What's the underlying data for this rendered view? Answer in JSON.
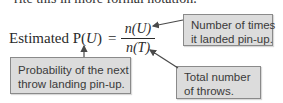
{
  "intro_text": "rite this in more formal notation.",
  "formula": {
    "lhs_prefix": "Estimated P(",
    "lhs_var": "U",
    "lhs_suffix": ")",
    "equals": "=",
    "numerator": "n(U)",
    "denominator": "n(T)"
  },
  "callouts": {
    "numerator_note": [
      "Number of times",
      "it landed pin-up."
    ],
    "probability_note": [
      "Probability of the next",
      "throw landing pin-up."
    ],
    "denominator_note": [
      "Total number",
      "of throws."
    ]
  },
  "colors": {
    "callout_fill": "#dcdcdc",
    "callout_border": "#8a8a8a",
    "arrow": "#4a4a4a",
    "text": "#2a2a2a"
  }
}
